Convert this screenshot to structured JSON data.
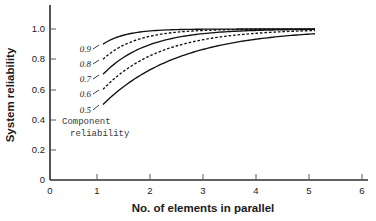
{
  "chart_data": {
    "type": "line",
    "title": "",
    "xlabel": "No. of elements in parallel",
    "ylabel": "System reliability",
    "xlim": [
      0,
      6
    ],
    "ylim": [
      0,
      1.05
    ],
    "xticks": [
      "0",
      "1",
      "2",
      "3",
      "4",
      "5",
      "6"
    ],
    "xtick_values": [
      0,
      1,
      2,
      3,
      4,
      5,
      6
    ],
    "yticks": [
      "0",
      "0.2",
      "0.4",
      "0.6",
      "0.8",
      "1.0"
    ],
    "ytick_values": [
      0,
      0.2,
      0.4,
      0.6,
      0.8,
      1.0
    ],
    "grid": false,
    "legend_position": "inline-curve-labels",
    "annotation": {
      "line1": "Component",
      "line2": "reliability"
    },
    "x": [
      1,
      2,
      3,
      4,
      5
    ],
    "series": [
      {
        "name": "0.9",
        "label": "0.9",
        "component_reliability": 0.9,
        "style": "solid",
        "color": "#111111",
        "values": [
          0.9,
          0.99,
          0.999,
          0.9999,
          0.99999
        ]
      },
      {
        "name": "0.8",
        "label": "0.8",
        "component_reliability": 0.8,
        "style": "dashed",
        "color": "#111111",
        "values": [
          0.8,
          0.96,
          0.992,
          0.9984,
          0.99968
        ]
      },
      {
        "name": "0.7",
        "label": "0.7",
        "component_reliability": 0.7,
        "style": "solid",
        "color": "#111111",
        "values": [
          0.7,
          0.91,
          0.973,
          0.9919,
          0.99757
        ]
      },
      {
        "name": "0.6",
        "label": "0.6",
        "component_reliability": 0.6,
        "style": "dashed",
        "color": "#111111",
        "values": [
          0.6,
          0.84,
          0.936,
          0.9744,
          0.98976
        ]
      },
      {
        "name": "0.5",
        "label": "0.5",
        "component_reliability": 0.5,
        "style": "solid",
        "color": "#111111",
        "values": [
          0.5,
          0.75,
          0.875,
          0.9375,
          0.96875
        ]
      }
    ]
  },
  "colors": {
    "axis": "#2b2b2b",
    "curve": "#111111",
    "text": "#1a1a1a",
    "annotation": "#3a3a3a",
    "background": "#ffffff"
  }
}
